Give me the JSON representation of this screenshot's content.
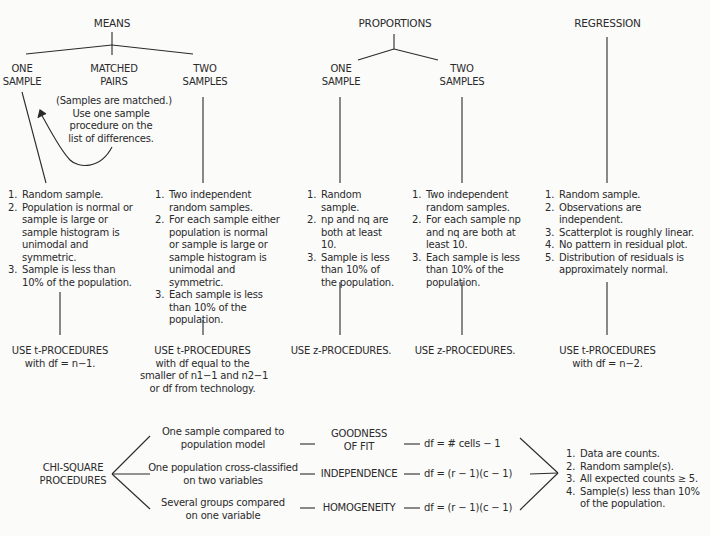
{
  "means": {
    "header": "MEANS",
    "one_sample": {
      "label_line1": "ONE",
      "label_line2": "SAMPLE",
      "conditions": [
        "Random sample.",
        "Population is normal or sample is large or sample histogram is unimodal and symmetric.",
        "Sample is less than 10% of the population."
      ],
      "result_line1": "USE t-PROCEDURES",
      "result_line2": "with df = n−1."
    },
    "matched_pairs": {
      "label_line1": "MATCHED",
      "label_line2": "PAIRS",
      "note_line1": "(Samples are matched.)",
      "note_line2": "Use one sample",
      "note_line3": "procedure on the",
      "note_line4": "list of differences."
    },
    "two_samples": {
      "label_line1": "TWO",
      "label_line2": "SAMPLES",
      "conditions": [
        "Two independent random samples.",
        "For each sample either population is normal or sample is large or sample histogram is unimodal and symmetric.",
        "Each sample is less than 10% of the population."
      ],
      "result_line1": "USE t-PROCEDURES",
      "result_line2": "with df equal to the",
      "result_line3": "smaller of n1−1 and n2−1",
      "result_line4": "or df from technology."
    }
  },
  "proportions": {
    "header": "PROPORTIONS",
    "one_sample": {
      "label_line1": "ONE",
      "label_line2": "SAMPLE",
      "conditions": [
        "Random sample.",
        "np and nq are both at least 10.",
        "Sample is less than 10% of the population."
      ],
      "result": "USE z-PROCEDURES."
    },
    "two_samples": {
      "label_line1": "TWO",
      "label_line2": "SAMPLES",
      "conditions": [
        "Two independent random samples.",
        "For each sample np and nq are both at least 10.",
        "Each sample is less than 10% of the population."
      ],
      "result": "USE z-PROCEDURES."
    }
  },
  "regression": {
    "header": "REGRESSION",
    "conditions": [
      "Random sample.",
      "Observations are independent.",
      "Scatterplot is roughly linear.",
      "No pattern in residual plot.",
      "Distribution of residuals is approximately normal."
    ],
    "result_line1": "USE t-PROCEDURES",
    "result_line2": "with df = n−2."
  },
  "chi_square": {
    "label_line1": "CHI-SQUARE",
    "label_line2": "PROCEDURES",
    "tests": [
      {
        "description_line1": "One sample compared to",
        "description_line2": "population model",
        "name_line1": "GOODNESS",
        "name_line2": "OF FIT",
        "df": "df = # cells − 1"
      },
      {
        "description_line1": "One population cross-classified",
        "description_line2": "on two variables",
        "name_line1": "INDEPENDENCE",
        "name_line2": "",
        "df": "df = (r − 1)(c − 1)"
      },
      {
        "description_line1": "Several groups compared",
        "description_line2": "on one variable",
        "name_line1": "HOMOGENEITY",
        "name_line2": "",
        "df": "df = (r − 1)(c − 1)"
      }
    ],
    "conditions": [
      "Data are counts.",
      "Random sample(s).",
      "All expected counts ≥ 5.",
      "Sample(s) less than 10% of the population."
    ]
  }
}
